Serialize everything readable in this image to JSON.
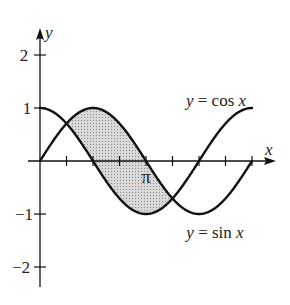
{
  "chart_data": {
    "type": "line",
    "title": "",
    "xlabel": "x",
    "ylabel": "y",
    "xlim": [
      0,
      6.283
    ],
    "ylim": [
      -2,
      2
    ],
    "x_ticks": [
      "0",
      "π/4",
      "π/2",
      "3π/4",
      "π",
      "5π/4",
      "3π/2",
      "7π/4",
      "2π"
    ],
    "x_tick_labels_shown": {
      "pi": "π"
    },
    "y_tick_labels": [
      "2",
      "1",
      "−1",
      "−2"
    ],
    "grid": false,
    "series": [
      {
        "name": "y = cos x",
        "function": "cos(x)",
        "x_range": [
          0,
          6.283
        ]
      },
      {
        "name": "y = sin x",
        "function": "sin(x)",
        "x_range": [
          0,
          6.283
        ]
      }
    ],
    "shaded_region": {
      "description": "Region between y = sin x (top) and y = cos x (bottom)",
      "x_from": "π/4",
      "x_to": "5π/4",
      "fill": "#cfcfcf"
    },
    "annotations": [
      {
        "text": "y = cos x",
        "near": "cos curve, upper right"
      },
      {
        "text": "y = sin x",
        "near": "sin curve, lower right"
      }
    ]
  },
  "labels": {
    "y_axis": "y",
    "x_axis": "x",
    "y_tick_2": "2",
    "y_tick_1": "1",
    "y_tick_m1": "−1",
    "y_tick_m2": "−2",
    "pi": "π",
    "cos_label": "y = cos x",
    "sin_label": "y = sin x"
  },
  "colors": {
    "stroke": "#111111",
    "shade": "#cfcfcf"
  }
}
